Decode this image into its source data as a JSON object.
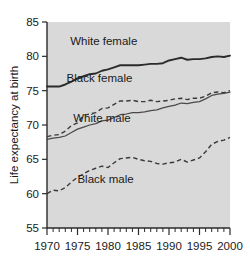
{
  "chart_data": {
    "type": "line",
    "title": "",
    "subtitle": "",
    "xlabel": "",
    "ylabel": "Life expectancy at birth",
    "xlim": [
      1970,
      2000
    ],
    "ylim": [
      55,
      85
    ],
    "grid": false,
    "legend_position": "inline-annotations",
    "background_color": "#d9d9d9",
    "line_color": "#2b2b2b",
    "x_tick_labels": [
      "1970",
      "1975",
      "1980",
      "1985",
      "1990",
      "1995",
      "2000"
    ],
    "x_tick_values": [
      1970,
      1975,
      1980,
      1985,
      1990,
      1995,
      2000
    ],
    "x_minor_tick_step": 1,
    "y_tick_labels": [
      "55",
      "60",
      "65",
      "70",
      "75",
      "80",
      "85"
    ],
    "y_tick_values": [
      55,
      60,
      65,
      70,
      75,
      80,
      85
    ],
    "x": [
      1970,
      1971,
      1972,
      1973,
      1974,
      1975,
      1976,
      1977,
      1978,
      1979,
      1980,
      1981,
      1982,
      1983,
      1984,
      1985,
      1986,
      1987,
      1988,
      1989,
      1990,
      1991,
      1992,
      1993,
      1994,
      1995,
      1996,
      1997,
      1998,
      1999,
      2000
    ],
    "series": [
      {
        "name": "White female",
        "style": "solid-thick",
        "label_x": 1979.3,
        "label_y": 81.6,
        "values": [
          75.6,
          75.6,
          75.6,
          75.9,
          76.3,
          76.8,
          77.1,
          77.4,
          77.5,
          77.9,
          78.1,
          78.4,
          78.7,
          78.7,
          78.7,
          78.7,
          78.8,
          78.9,
          78.9,
          79.0,
          79.4,
          79.6,
          79.8,
          79.5,
          79.6,
          79.6,
          79.7,
          79.9,
          80.0,
          79.9,
          80.1
        ]
      },
      {
        "name": "Black female",
        "style": "dashed",
        "label_x": 1978.6,
        "label_y": 76.3,
        "values": [
          68.3,
          68.5,
          68.6,
          69.1,
          69.9,
          70.3,
          71.4,
          71.6,
          71.8,
          72.4,
          72.5,
          73.0,
          73.5,
          73.5,
          73.6,
          73.4,
          73.4,
          73.6,
          73.4,
          73.5,
          73.6,
          73.8,
          73.9,
          73.7,
          73.9,
          73.9,
          74.2,
          74.7,
          74.8,
          74.7,
          75.0
        ]
      },
      {
        "name": "White male",
        "style": "solid-thin",
        "label_x": 1979.0,
        "label_y": 70.4,
        "values": [
          67.9,
          68.1,
          68.2,
          68.4,
          68.9,
          69.4,
          69.7,
          70.0,
          70.2,
          70.6,
          70.7,
          71.1,
          71.5,
          71.6,
          71.8,
          71.8,
          71.9,
          72.1,
          72.2,
          72.5,
          72.7,
          72.9,
          73.2,
          73.1,
          73.3,
          73.4,
          73.8,
          74.3,
          74.5,
          74.6,
          74.8
        ]
      },
      {
        "name": "Black male",
        "style": "dashed",
        "label_x": 1979.6,
        "label_y": 61.5,
        "values": [
          60.0,
          60.5,
          60.4,
          60.9,
          61.7,
          62.4,
          62.9,
          63.4,
          63.7,
          64.0,
          63.8,
          64.5,
          65.1,
          65.2,
          65.3,
          65.0,
          64.8,
          64.7,
          64.4,
          64.3,
          64.5,
          64.6,
          65.0,
          64.6,
          64.9,
          65.2,
          66.1,
          67.2,
          67.6,
          67.8,
          68.2
        ]
      }
    ]
  },
  "axes": {
    "y_axis_title": "Life expectancy at birth"
  }
}
